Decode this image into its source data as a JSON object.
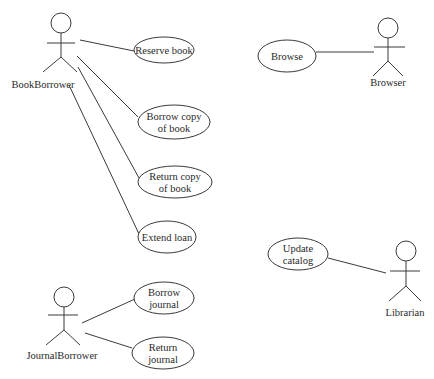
{
  "diagram": {
    "type": "uml-use-case",
    "colors": {
      "line": "#3a3a3a",
      "text": "#2a2a2a",
      "background": "#ffffff"
    },
    "actors": [
      {
        "id": "book_borrower",
        "label": "BookBorrower",
        "head": [
          61,
          23
        ],
        "arms_y": 43,
        "arm_x": [
          47,
          75
        ],
        "body_end": 57,
        "legs": [
          [
            43,
            72
          ],
          [
            77,
            72
          ]
        ],
        "label_pos": [
          43,
          88
        ]
      },
      {
        "id": "browser",
        "label": "Browser",
        "head": [
          388,
          28
        ],
        "arms_y": 47,
        "arm_x": [
          374,
          405
        ],
        "body_end": 61,
        "legs": [
          [
            373,
            76
          ],
          [
            403,
            76
          ]
        ],
        "label_pos": [
          388,
          86
        ]
      },
      {
        "id": "librarian",
        "label": "Librarian",
        "head": [
          406,
          251
        ],
        "arms_y": 271,
        "arm_x": [
          390,
          420
        ],
        "body_end": 286,
        "legs": [
          [
            389,
            301
          ],
          [
            421,
            301
          ]
        ],
        "label_pos": [
          405,
          316
        ]
      },
      {
        "id": "journal_borrower",
        "label": "JournalBorrower",
        "head": [
          64,
          297
        ],
        "arms_y": 315,
        "arm_x": [
          48,
          78
        ],
        "body_end": 330,
        "legs": [
          [
            46,
            345
          ],
          [
            80,
            345
          ]
        ],
        "label_pos": [
          62,
          359
        ]
      }
    ],
    "use_cases": [
      {
        "id": "reserve_book",
        "lines": [
          "Reserve book"
        ],
        "cx": 164,
        "cy": 50,
        "rx": 30,
        "ry": 13
      },
      {
        "id": "borrow_copy",
        "lines": [
          "Borrow copy",
          "of book"
        ],
        "cx": 174,
        "cy": 122,
        "rx": 36,
        "ry": 17
      },
      {
        "id": "return_copy",
        "lines": [
          "Return copy",
          "of book"
        ],
        "cx": 175,
        "cy": 182,
        "rx": 37,
        "ry": 16
      },
      {
        "id": "extend_loan",
        "lines": [
          "Extend loan"
        ],
        "cx": 167,
        "cy": 237,
        "rx": 29,
        "ry": 16
      },
      {
        "id": "browse",
        "lines": [
          "Browse"
        ],
        "cx": 287,
        "cy": 56,
        "rx": 29,
        "ry": 16
      },
      {
        "id": "update_catalog",
        "lines": [
          "Update",
          "catalog"
        ],
        "cx": 298,
        "cy": 254,
        "rx": 30,
        "ry": 16
      },
      {
        "id": "borrow_journal",
        "lines": [
          "Borrow",
          "journal"
        ],
        "cx": 164,
        "cy": 298,
        "rx": 30,
        "ry": 16
      },
      {
        "id": "return_journal",
        "lines": [
          "Return",
          "journal"
        ],
        "cx": 163,
        "cy": 353,
        "rx": 31,
        "ry": 16
      }
    ],
    "associations": [
      {
        "from": "book_borrower",
        "to": "reserve_book",
        "p1": [
          80,
          40
        ],
        "p2": [
          134,
          51
        ]
      },
      {
        "from": "book_borrower",
        "to": "borrow_copy",
        "p1": [
          77,
          56
        ],
        "p2": [
          138,
          117
        ]
      },
      {
        "from": "book_borrower",
        "to": "return_copy",
        "p1": [
          78,
          67
        ],
        "p2": [
          139,
          178
        ]
      },
      {
        "from": "book_borrower",
        "to": "extend_loan",
        "p1": [
          69,
          85
        ],
        "p2": [
          139,
          234
        ]
      },
      {
        "from": "browser",
        "to": "browse",
        "p1": [
          316,
          52
        ],
        "p2": [
          374,
          52
        ]
      },
      {
        "from": "librarian",
        "to": "update_catalog",
        "p1": [
          328,
          258
        ],
        "p2": [
          386,
          273
        ]
      },
      {
        "from": "journal_borrower",
        "to": "borrow_journal",
        "p1": [
          82,
          323
        ],
        "p2": [
          135,
          299
        ]
      },
      {
        "from": "journal_borrower",
        "to": "return_journal",
        "p1": [
          85,
          333
        ],
        "p2": [
          132,
          348
        ]
      }
    ]
  }
}
